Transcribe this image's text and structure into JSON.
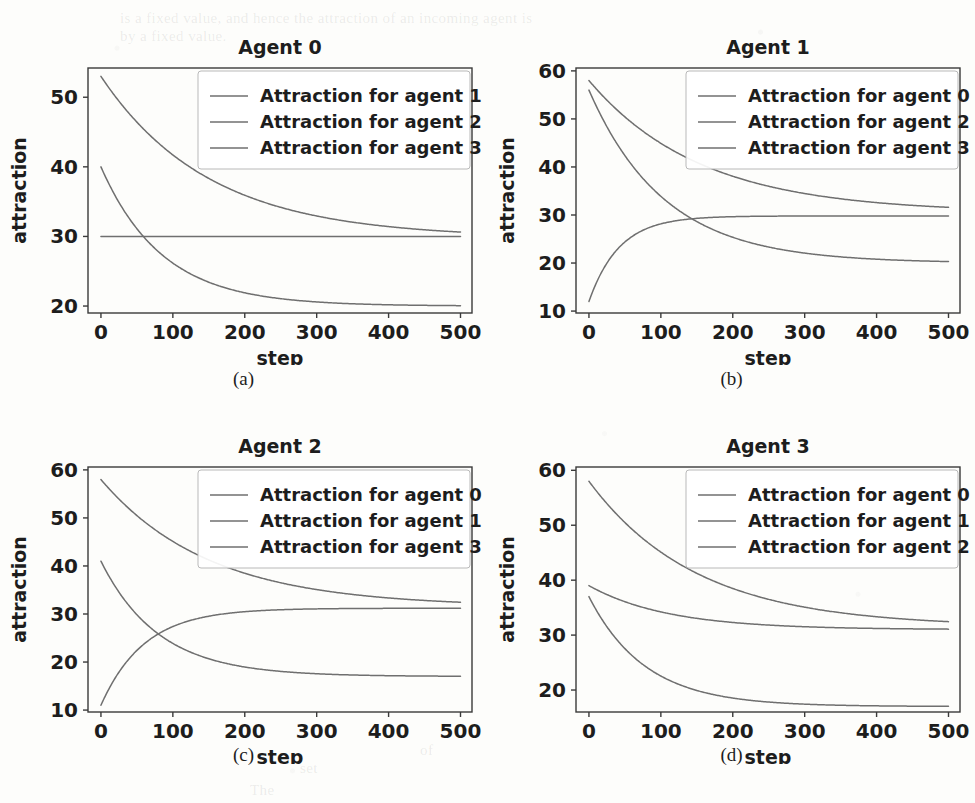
{
  "figure": {
    "layout": "2x2 grid of line charts",
    "page_background": "#fdfdfb",
    "line_color": "#6f6f6f",
    "axis_color": "#3a3a3a",
    "text_color": "#1d1d1d"
  },
  "ghost_text": [
    {
      "text": "is a fixed value, and hence the attraction of an incoming agent is",
      "x": 120,
      "y": 10
    },
    {
      "text": "by a fixed value.",
      "x": 120,
      "y": 28
    },
    {
      "text": "set",
      "x": 300,
      "y": 760
    },
    {
      "text": "of",
      "x": 420,
      "y": 742
    },
    {
      "text": "The",
      "x": 250,
      "y": 782
    }
  ],
  "panels": [
    {
      "id": "a",
      "caption": "(a)",
      "chart_data": {
        "type": "line",
        "title": "Agent 0",
        "xlabel": "step",
        "ylabel": "attraction",
        "xlim": [
          -18,
          516
        ],
        "ylim": [
          19.0,
          54.2
        ],
        "xticks": [
          0,
          100,
          200,
          300,
          400,
          500
        ],
        "yticks": [
          20,
          30,
          40,
          50
        ],
        "grid": false,
        "legend_position": "upper right",
        "series": [
          {
            "name": "Attraction for agent 1",
            "model": "exponential_decay",
            "start": 53.0,
            "end": 29.8,
            "tau": 150,
            "x": [
              0,
              25,
              50,
              75,
              100,
              125,
              150,
              175,
              200,
              225,
              250,
              275,
              300,
              350,
              400,
              450,
              500
            ],
            "values": [
              53.0,
              49.1,
              45.6,
              42.6,
              40.0,
              37.7,
              35.7,
              34.0,
              32.5,
              31.3,
              30.2,
              29.3,
              28.5,
              27.3,
              26.5,
              25.9,
              25.6
            ]
          },
          {
            "name": "Attraction for agent 2",
            "model": "constant",
            "start": 30.0,
            "end": 30.0,
            "x": [
              0,
              100,
              200,
              300,
              400,
              500
            ],
            "values": [
              30.0,
              30.0,
              30.0,
              30.0,
              30.0,
              30.0
            ]
          },
          {
            "name": "Attraction for agent 3",
            "model": "exponential_decay",
            "start": 40.0,
            "end": 20.0,
            "tau": 85,
            "x": [
              0,
              25,
              50,
              75,
              100,
              125,
              150,
              175,
              200,
              250,
              300,
              400,
              500
            ],
            "values": [
              40.0,
              35.1,
              31.5,
              28.8,
              26.9,
              25.4,
              24.3,
              23.5,
              22.9,
              22.0,
              21.4,
              20.7,
              20.2
            ]
          }
        ]
      }
    },
    {
      "id": "b",
      "caption": "(b)",
      "chart_data": {
        "type": "line",
        "title": "Agent 1",
        "xlabel": "step",
        "ylabel": "attraction",
        "xlim": [
          -18,
          516
        ],
        "ylim": [
          9.6,
          60.6
        ],
        "xticks": [
          0,
          100,
          200,
          300,
          400,
          500
        ],
        "yticks": [
          10,
          20,
          30,
          40,
          50,
          60
        ],
        "grid": false,
        "legend_position": "upper right",
        "series": [
          {
            "name": "Attraction for agent 0",
            "model": "exponential_decay",
            "start": 58.0,
            "end": 30.5,
            "tau": 155,
            "x": [
              0,
              25,
              50,
              75,
              100,
              150,
              200,
              250,
              300,
              350,
              400,
              450,
              500
            ],
            "values": [
              58.0,
              54.3,
              51.0,
              48.1,
              45.5,
              41.3,
              38.1,
              35.7,
              33.9,
              32.6,
              31.7,
              31.0,
              30.5
            ]
          },
          {
            "name": "Attraction for agent 2",
            "model": "exponential_growth",
            "start": 12.0,
            "end": 29.8,
            "tau": 42,
            "x": [
              0,
              10,
              25,
              50,
              75,
              100,
              125,
              150,
              200,
              250,
              300,
              400,
              500
            ],
            "values": [
              12.0,
              18.0,
              22.5,
              26.0,
              27.6,
              28.4,
              28.8,
              29.0,
              29.2,
              29.4,
              29.5,
              29.6,
              29.8
            ]
          },
          {
            "name": "Attraction for agent 3",
            "model": "exponential_decay",
            "start": 56.0,
            "end": 20.0,
            "tau": 105,
            "x": [
              0,
              25,
              50,
              75,
              100,
              125,
              150,
              175,
              200,
              250,
              300,
              400,
              500
            ],
            "values": [
              56.0,
              50.6,
              45.9,
              41.8,
              38.2,
              35.1,
              32.4,
              30.0,
              28.0,
              25.0,
              23.0,
              21.0,
              20.0
            ]
          }
        ]
      }
    },
    {
      "id": "c",
      "caption": "(c)",
      "chart_data": {
        "type": "line",
        "title": "Agent 2",
        "xlabel": "step",
        "ylabel": "attraction",
        "xlim": [
          -18,
          516
        ],
        "ylim": [
          9.6,
          60.6
        ],
        "xticks": [
          0,
          100,
          200,
          300,
          400,
          500
        ],
        "yticks": [
          10,
          20,
          30,
          40,
          50,
          60
        ],
        "grid": false,
        "legend_position": "upper right",
        "series": [
          {
            "name": "Attraction for agent 0",
            "model": "exponential_decay",
            "start": 58.0,
            "end": 31.5,
            "tau": 150,
            "x": [
              0,
              25,
              50,
              75,
              100,
              150,
              200,
              250,
              300,
              350,
              400,
              450,
              500
            ],
            "values": [
              58.0,
              54.4,
              51.2,
              48.4,
              45.9,
              41.7,
              38.6,
              36.2,
              34.5,
              33.3,
              32.5,
              31.9,
              31.5
            ]
          },
          {
            "name": "Attraction for agent 1",
            "model": "exponential_growth",
            "start": 11.0,
            "end": 31.2,
            "tau": 60,
            "x": [
              0,
              10,
              25,
              50,
              75,
              100,
              125,
              150,
              200,
              250,
              300,
              400,
              500
            ],
            "values": [
              11.0,
              17.5,
              22.0,
              26.2,
              28.2,
              29.2,
              29.8,
              30.1,
              30.5,
              30.8,
              31.0,
              31.1,
              31.2
            ]
          },
          {
            "name": "Attraction for agent 3",
            "model": "exponential_decay",
            "start": 41.0,
            "end": 17.0,
            "tau": 80,
            "x": [
              0,
              25,
              50,
              75,
              100,
              125,
              150,
              175,
              200,
              250,
              300,
              400,
              500
            ],
            "values": [
              41.0,
              36.6,
              32.9,
              29.9,
              27.5,
              25.5,
              23.9,
              22.5,
              21.4,
              19.7,
              18.6,
              17.5,
              17.0
            ]
          }
        ]
      }
    },
    {
      "id": "d",
      "caption": "(d)",
      "chart_data": {
        "type": "line",
        "title": "Agent 3",
        "xlabel": "step",
        "ylabel": "attraction",
        "xlim": [
          -18,
          516
        ],
        "ylim": [
          16.0,
          60.6
        ],
        "xticks": [
          0,
          100,
          200,
          300,
          400,
          500
        ],
        "yticks": [
          20,
          30,
          40,
          50,
          60
        ],
        "grid": false,
        "legend_position": "upper right",
        "series": [
          {
            "name": "Attraction for agent 0",
            "model": "exponential_decay",
            "start": 58.0,
            "end": 31.5,
            "tau": 150,
            "x": [
              0,
              25,
              50,
              75,
              100,
              150,
              200,
              250,
              300,
              350,
              400,
              450,
              500
            ],
            "values": [
              58.0,
              54.4,
              51.2,
              48.4,
              45.9,
              41.7,
              38.6,
              36.2,
              34.5,
              33.3,
              32.5,
              31.9,
              31.5
            ]
          },
          {
            "name": "Attraction for agent 1",
            "model": "exponential_decay",
            "start": 39.0,
            "end": 31.0,
            "tau": 110,
            "x": [
              0,
              25,
              50,
              75,
              100,
              150,
              200,
              250,
              300,
              400,
              500
            ],
            "values": [
              39.0,
              37.3,
              36.0,
              35.0,
              34.2,
              33.0,
              32.3,
              31.9,
              31.6,
              31.2,
              31.0
            ]
          },
          {
            "name": "Attraction for agent 2",
            "model": "exponential_decay",
            "start": 37.0,
            "end": 17.0,
            "tau": 78,
            "x": [
              0,
              25,
              50,
              75,
              100,
              125,
              150,
              175,
              200,
              250,
              300,
              400,
              500
            ],
            "values": [
              37.0,
              33.2,
              30.0,
              27.4,
              25.3,
              23.5,
              22.1,
              21.0,
              20.1,
              18.7,
              17.9,
              17.2,
              17.0
            ]
          }
        ]
      }
    }
  ]
}
